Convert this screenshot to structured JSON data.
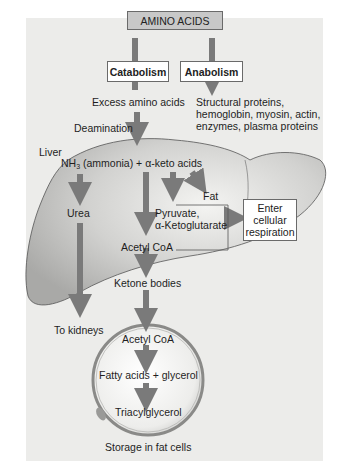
{
  "diagram": {
    "root": "AMINO ACIDS",
    "branches": {
      "catabolism": "Catabolism",
      "anabolism": "Anabolism"
    },
    "anabolism_products": [
      "Structural proteins,",
      "hemoglobin, myosin, actin,",
      "enzymes, plasma proteins"
    ],
    "catabolism_steps": {
      "excess": "Excess amino acids",
      "deamination": "Deamination",
      "liver_label": "Liver",
      "nh3_prefix": "NH",
      "nh3_sub": "3",
      "nh3_suffix": " (ammonia) + α-keto acids",
      "urea": "Urea",
      "fat": "Fat",
      "pyruvate": "Pyruvate,",
      "ketoglutarate": "α-Ketoglutarate",
      "acetyl_coa": "Acetyl CoA",
      "ketone_bodies": "Ketone bodies",
      "to_kidneys": "To kidneys"
    },
    "respiration_box": [
      "Enter",
      "cellular",
      "respiration"
    ],
    "fat_cell": {
      "acetyl_coa": "Acetyl CoA",
      "fatty_acids": "Fatty acids + glycerol",
      "triacylglycerol": "Triacylglycerol",
      "caption": "Storage in fat cells"
    },
    "colors": {
      "panel": "#ececea",
      "liver": "#c9c9c7",
      "arrow": "#7a7a7a",
      "root_box": "#c8c8c8"
    }
  }
}
